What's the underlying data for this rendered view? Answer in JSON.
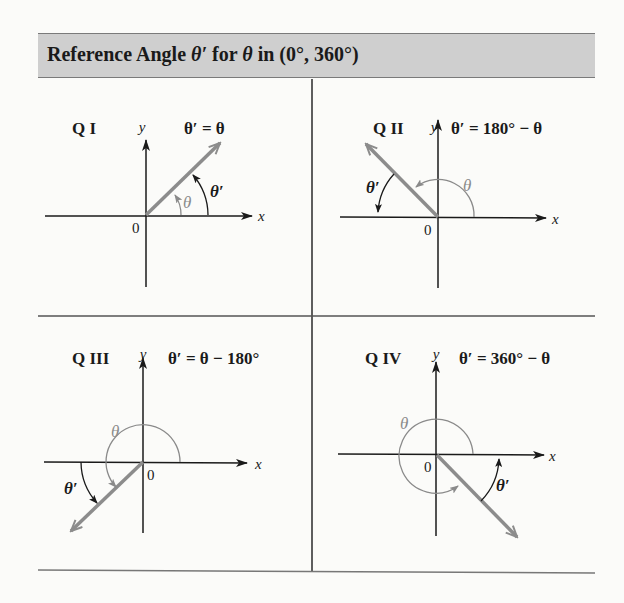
{
  "header": {
    "title_prefix": "Reference Angle ",
    "theta_prime": "θ′",
    "title_mid": " for ",
    "theta": "θ",
    "title_suffix": " in (0°, 360°)"
  },
  "colors": {
    "header_bg": "#cfcfcf",
    "axis": "#1a1a1a",
    "terminal_ray": "#8c8c8c",
    "theta_arc": "#8a8a8a",
    "reference_arc": "#1a1a1a"
  },
  "axis_labels": {
    "x": "x",
    "y": "y",
    "origin": "0"
  },
  "quadrants": [
    {
      "id": "QI",
      "label": "Q I",
      "formula": "θ′ = θ",
      "theta_label": "θ",
      "ref_label": "θ′"
    },
    {
      "id": "QII",
      "label": "Q II",
      "formula": "θ′ = 180° − θ",
      "theta_label": "θ",
      "ref_label": "θ′"
    },
    {
      "id": "QIII",
      "label": "Q III",
      "formula": "θ′ = θ − 180°",
      "theta_label": "θ",
      "ref_label": "θ′"
    },
    {
      "id": "QIV",
      "label": "Q IV",
      "formula": "θ′ = 360° − θ",
      "theta_label": "θ",
      "ref_label": "θ′"
    }
  ]
}
